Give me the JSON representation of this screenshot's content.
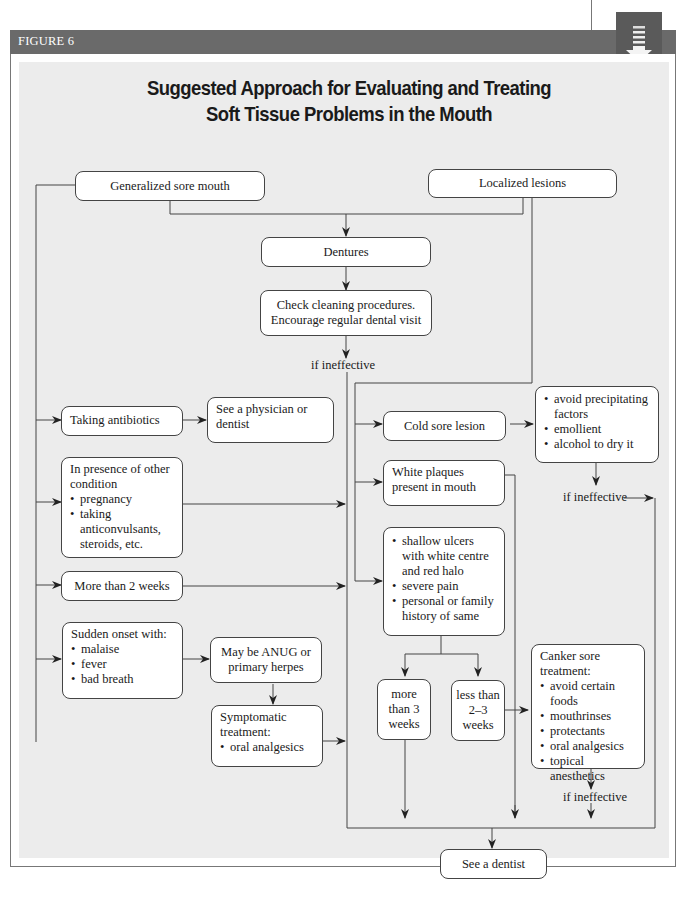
{
  "header": {
    "figure_label": "FIGURE 6",
    "badge_icon": "download-arrow-icon"
  },
  "title": {
    "line1": "Suggested Approach for Evaluating and Treating",
    "line2": "Soft Tissue Problems in the Mouth"
  },
  "nodes": {
    "generalized": "Generalized sore mouth",
    "localized": "Localized lesions",
    "dentures": "Dentures",
    "check_cleaning": {
      "line1": "Check cleaning procedures.",
      "line2": "Encourage regular dental visit"
    },
    "taking_antibiotics": "Taking antibiotics",
    "see_physician": "See a physician or dentist",
    "other_condition": {
      "heading": "In presence of other condition",
      "items": [
        "pregnancy",
        "taking anticonvulsants, steroids, etc."
      ]
    },
    "more_than_2_weeks": "More than 2 weeks",
    "sudden_onset": {
      "heading": "Sudden onset with:",
      "items": [
        "malaise",
        "fever",
        "bad breath"
      ]
    },
    "anug": "May be ANUG or primary herpes",
    "symptomatic": {
      "heading": "Symptomatic treatment:",
      "items": [
        "oral analgesics"
      ]
    },
    "cold_sore": "Cold sore lesion",
    "cold_sore_treatment": {
      "items": [
        "avoid precipitating factors",
        "emollient",
        "alcohol to dry it"
      ]
    },
    "white_plaques": "White plaques present in mouth",
    "ulcers": {
      "items": [
        "shallow ulcers with white centre and red halo",
        "severe pain",
        "personal or family history of same"
      ]
    },
    "more_than_3_weeks": "more than 3 weeks",
    "less_than_2_3_weeks": "less than 2–3 weeks",
    "canker_treatment": {
      "heading": "Canker sore treatment:",
      "items": [
        "avoid certain foods",
        "mouthrinses",
        "protectants",
        "oral analgesics",
        "topical anesthetics"
      ]
    },
    "see_dentist": "See a dentist"
  },
  "labels": {
    "if_ineffective_1": "if ineffective",
    "if_ineffective_2": "if ineffective",
    "if_ineffective_3": "if ineffective"
  },
  "colors": {
    "header_bar": "#6a6a6a",
    "panel_bg": "#ececec",
    "box_bg": "#ffffff",
    "line": "#444444"
  }
}
